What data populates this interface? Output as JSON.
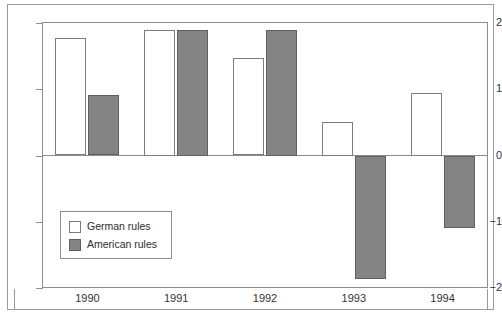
{
  "chart_data": {
    "type": "bar",
    "title": "",
    "subtitle": "",
    "xlabel": "",
    "ylabel": "",
    "categories": [
      "1990",
      "1991",
      "1992",
      "1993",
      "1994"
    ],
    "series": [
      {
        "name": "German rules",
        "color": "#ffffff",
        "values": [
          1.77,
          1.9,
          1.47,
          0.5,
          0.95
        ]
      },
      {
        "name": "American rules",
        "color": "#848484",
        "values": [
          0.92,
          1.9,
          1.9,
          -1.86,
          -1.1
        ]
      }
    ],
    "ylim": [
      -2,
      2
    ],
    "yticks": [
      2,
      1,
      0,
      -1,
      -2
    ],
    "ytick_labels": [
      "2",
      "1",
      "0",
      "−1",
      "−2"
    ],
    "grid": false,
    "zero_line": true,
    "legend_position": "inside-lower-left",
    "legend_entries": [
      "German rules",
      "American rules"
    ]
  },
  "legend": {
    "items": [
      {
        "label": "German rules",
        "swatch": "white-square-icon"
      },
      {
        "label": "American rules",
        "swatch": "gray-square-icon"
      }
    ]
  },
  "colors": {
    "german_fill": "#ffffff",
    "american_fill": "#848484",
    "bar_stroke": "#6e6e6e",
    "axis": "#8d8d8d",
    "frame": "#9a9a9a",
    "text": "#333333",
    "background": "#ffffff"
  }
}
